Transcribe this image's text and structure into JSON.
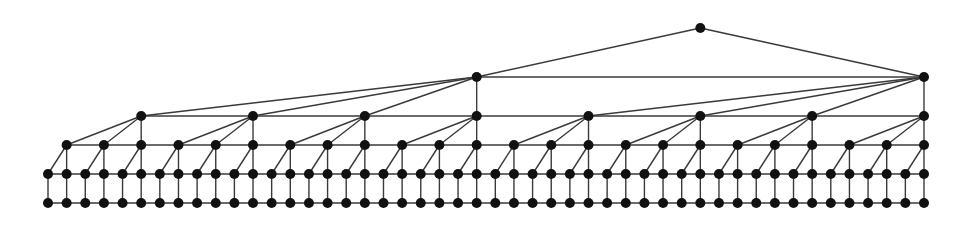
{
  "diagram": {
    "type": "hierarchical-tree-graph",
    "colors": {
      "node": "#111111",
      "edge": "#3a3a3a",
      "background": "#ffffff"
    },
    "node_radius": 5,
    "base": {
      "count": 48,
      "x0": 48,
      "dx": 18.638
    },
    "levels": [
      {
        "name": "row-5",
        "y": 203,
        "indices": "all",
        "horizontal_line": true
      },
      {
        "name": "row-4",
        "y": 174,
        "indices": "all",
        "horizontal_line": true
      },
      {
        "name": "row-3",
        "y": 145,
        "indices": [
          1,
          3,
          5,
          7,
          9,
          11,
          13,
          15,
          17,
          19,
          21,
          23,
          25,
          27,
          29,
          31,
          33,
          35,
          37,
          39,
          41,
          43,
          45,
          47
        ],
        "horizontal_line": true
      },
      {
        "name": "row-2",
        "y": 116,
        "indices": [
          5,
          11,
          17,
          23,
          29,
          35,
          41,
          47
        ],
        "horizontal_line": true
      },
      {
        "name": "row-1",
        "y": 77,
        "indices": [
          23,
          47
        ],
        "horizontal_line": true
      },
      {
        "name": "root",
        "y": 28,
        "indices": [
          35
        ],
        "horizontal_line": false
      }
    ],
    "groupings": [
      {
        "from": "row-4",
        "to": "row-3",
        "group_size": 2
      },
      {
        "from": "row-3",
        "to": "row-2",
        "group_size": 3
      },
      {
        "from": "row-2",
        "to": "row-1",
        "group_size": 4
      },
      {
        "from": "row-1",
        "to": "root",
        "group_size": 2
      }
    ],
    "vertical_links": [
      {
        "from": "row-5",
        "to": "row-4"
      }
    ]
  }
}
